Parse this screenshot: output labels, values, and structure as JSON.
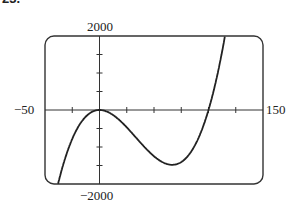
{
  "problem_number": "23.",
  "chart_data": {
    "type": "line",
    "title": "",
    "xlabel": "",
    "ylabel": "",
    "xlim": [
      -50,
      150
    ],
    "ylim": [
      -2000,
      2000
    ],
    "x_tick_step": 25,
    "y_tick_step": 500,
    "grid": false,
    "function_approx": "0.01x^3 - x^2",
    "series": [
      {
        "name": "f(x)",
        "x": [
          -37,
          -25,
          -10,
          0,
          20,
          40,
          60,
          66.7,
          80,
          100,
          110,
          115
        ],
        "y": [
          -2000,
          -781,
          -110,
          0,
          -320,
          -960,
          -1440,
          -1481,
          -1280,
          0,
          1210,
          2000
        ]
      }
    ],
    "axis_labels": {
      "x_min": "−50",
      "x_max": "150",
      "y_max": "2000",
      "y_min": "−2000"
    }
  }
}
